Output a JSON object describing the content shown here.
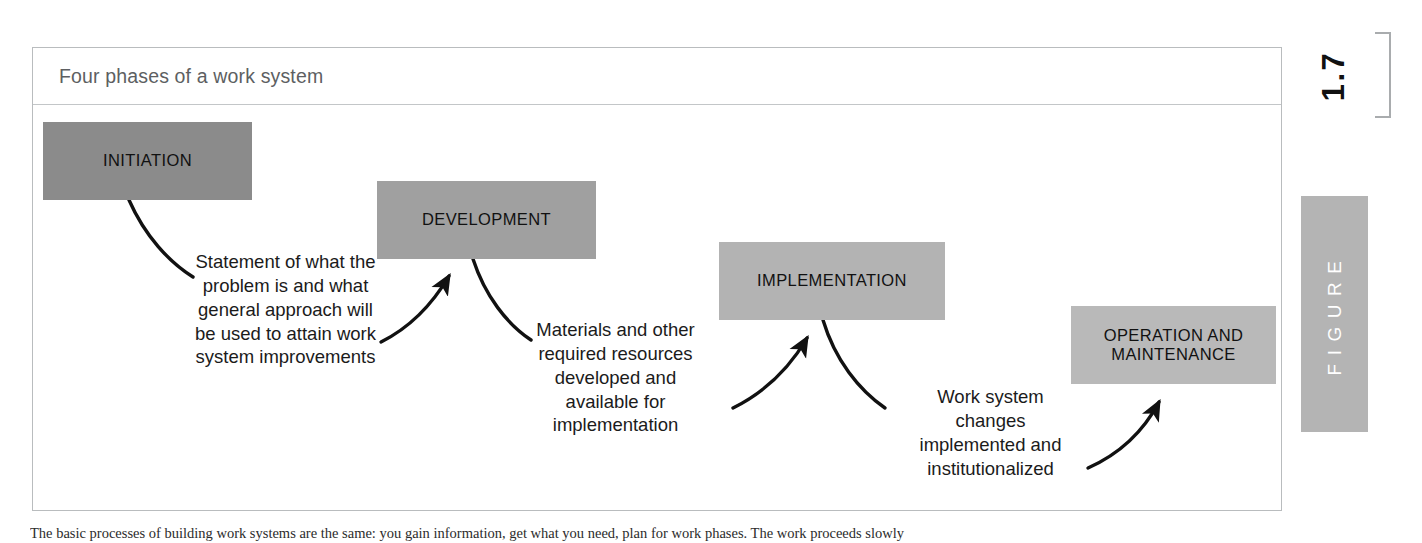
{
  "figure": {
    "title": "Four phases of a work system",
    "number": "1.7",
    "tab_label": "FIGURE",
    "frame_border_color": "#b9bcbe",
    "tab_color": "#b4b4b4"
  },
  "phases": [
    {
      "id": "initiation",
      "label": "INITIATION",
      "fill": "#8b8b8b",
      "order": 1
    },
    {
      "id": "development",
      "label": "DEVELOPMENT",
      "fill": "#a0a0a0",
      "order": 2
    },
    {
      "id": "implementation",
      "label": "IMPLEMENTATION",
      "fill": "#b3b3b3",
      "order": 3
    },
    {
      "id": "operation-and-maintenance",
      "label": "OPERATION AND\nMAINTENANCE",
      "fill": "#b9b9b9",
      "order": 4
    }
  ],
  "annotations": [
    {
      "id": "initiation-to-development",
      "text": "Statement of what the\nproblem is and what\ngeneral approach will\nbe used to attain work\nsystem improvements"
    },
    {
      "id": "development-to-implementation",
      "text": "Materials and other\nrequired resources\ndeveloped and\navailable for\nimplementation"
    },
    {
      "id": "implementation-to-operation",
      "text": "Work system\nchanges\nimplemented and\ninstitutionalized"
    }
  ],
  "caption": {
    "text": "The basic processes of building work systems are the same: you gain information, get what you need, plan for work phases. The work proceeds slowly"
  }
}
